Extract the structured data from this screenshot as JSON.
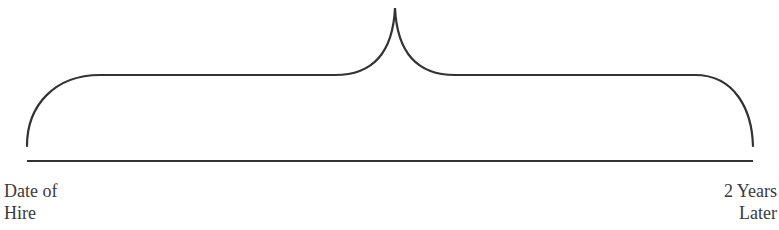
{
  "diagram": {
    "type": "timeline-brace",
    "stroke_color": "#333333",
    "start_label": {
      "line1": "Date of",
      "line2": "Hire"
    },
    "end_label": {
      "line1": "2 Years",
      "line2": "Later"
    }
  }
}
